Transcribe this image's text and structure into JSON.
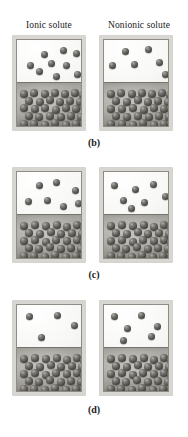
{
  "figure": {
    "background_color": "#ffffff",
    "sphere_color": "#56544f",
    "liquid_color": "#a8a6a0",
    "vapor_color": "#f7f7f5",
    "frame_color": "#d8d6d1"
  },
  "column_headers": [
    {
      "id": "ionic",
      "label": "Ionic solute"
    },
    {
      "id": "nonionic",
      "label": "Nonionic solute"
    }
  ],
  "panels": [
    {
      "id": "b",
      "caption": "(b)",
      "liquid_level_pct": 50,
      "beakers": [
        {
          "column": "ionic",
          "vapor_particles": [
            {
              "x": 24,
              "y": 11
            },
            {
              "x": 43,
              "y": 7
            },
            {
              "x": 56,
              "y": 10
            },
            {
              "x": 10,
              "y": 22
            },
            {
              "x": 31,
              "y": 20
            },
            {
              "x": 46,
              "y": 22
            },
            {
              "x": 19,
              "y": 28
            },
            {
              "x": 36,
              "y": 33
            },
            {
              "x": 57,
              "y": 31
            }
          ],
          "liquid_particles": [
            {
              "x": 3,
              "y": 50
            },
            {
              "x": 13,
              "y": 49
            },
            {
              "x": 24,
              "y": 50
            },
            {
              "x": 34,
              "y": 49
            },
            {
              "x": 44,
              "y": 50
            },
            {
              "x": 54,
              "y": 49
            },
            {
              "x": 62,
              "y": 51
            },
            {
              "x": 8,
              "y": 57
            },
            {
              "x": 19,
              "y": 58
            },
            {
              "x": 29,
              "y": 56
            },
            {
              "x": 39,
              "y": 58
            },
            {
              "x": 49,
              "y": 57
            },
            {
              "x": 59,
              "y": 58
            },
            {
              "x": 3,
              "y": 64
            },
            {
              "x": 14,
              "y": 65
            },
            {
              "x": 24,
              "y": 64
            },
            {
              "x": 35,
              "y": 66
            },
            {
              "x": 45,
              "y": 64
            },
            {
              "x": 55,
              "y": 65
            },
            {
              "x": 63,
              "y": 63
            },
            {
              "x": 8,
              "y": 72
            },
            {
              "x": 18,
              "y": 73
            },
            {
              "x": 29,
              "y": 72
            },
            {
              "x": 40,
              "y": 73
            },
            {
              "x": 50,
              "y": 72
            },
            {
              "x": 60,
              "y": 73
            },
            {
              "x": 3,
              "y": 80
            },
            {
              "x": 13,
              "y": 80
            },
            {
              "x": 24,
              "y": 81
            },
            {
              "x": 34,
              "y": 79
            },
            {
              "x": 45,
              "y": 81
            },
            {
              "x": 55,
              "y": 80
            },
            {
              "x": 63,
              "y": 79
            }
          ]
        },
        {
          "column": "nonionic",
          "vapor_particles": [
            {
              "x": 18,
              "y": 8
            },
            {
              "x": 41,
              "y": 6
            },
            {
              "x": 5,
              "y": 22
            },
            {
              "x": 27,
              "y": 21
            },
            {
              "x": 52,
              "y": 19
            },
            {
              "x": 58,
              "y": 31
            }
          ],
          "liquid_particles": [
            {
              "x": 3,
              "y": 50
            },
            {
              "x": 13,
              "y": 49
            },
            {
              "x": 24,
              "y": 50
            },
            {
              "x": 34,
              "y": 49
            },
            {
              "x": 44,
              "y": 50
            },
            {
              "x": 54,
              "y": 49
            },
            {
              "x": 62,
              "y": 51
            },
            {
              "x": 8,
              "y": 57
            },
            {
              "x": 19,
              "y": 58
            },
            {
              "x": 30,
              "y": 56
            },
            {
              "x": 40,
              "y": 58
            },
            {
              "x": 50,
              "y": 57
            },
            {
              "x": 60,
              "y": 58
            },
            {
              "x": 3,
              "y": 65
            },
            {
              "x": 14,
              "y": 65
            },
            {
              "x": 25,
              "y": 64
            },
            {
              "x": 36,
              "y": 66
            },
            {
              "x": 46,
              "y": 64
            },
            {
              "x": 56,
              "y": 65
            },
            {
              "x": 63,
              "y": 64
            },
            {
              "x": 8,
              "y": 72
            },
            {
              "x": 19,
              "y": 73
            },
            {
              "x": 30,
              "y": 72
            },
            {
              "x": 41,
              "y": 73
            },
            {
              "x": 51,
              "y": 72
            },
            {
              "x": 61,
              "y": 73
            },
            {
              "x": 3,
              "y": 80
            },
            {
              "x": 14,
              "y": 80
            },
            {
              "x": 25,
              "y": 81
            },
            {
              "x": 35,
              "y": 79
            },
            {
              "x": 46,
              "y": 81
            },
            {
              "x": 56,
              "y": 80
            },
            {
              "x": 63,
              "y": 79
            }
          ]
        }
      ]
    },
    {
      "id": "c",
      "caption": "(c)",
      "liquid_level_pct": 50,
      "beakers": [
        {
          "column": "ionic",
          "vapor_particles": [
            {
              "x": 19,
              "y": 10
            },
            {
              "x": 36,
              "y": 7
            },
            {
              "x": 55,
              "y": 15
            },
            {
              "x": 8,
              "y": 26
            },
            {
              "x": 27,
              "y": 25
            },
            {
              "x": 43,
              "y": 31
            },
            {
              "x": 58,
              "y": 28
            }
          ],
          "liquid_particles": [
            {
              "x": 3,
              "y": 50
            },
            {
              "x": 14,
              "y": 49
            },
            {
              "x": 25,
              "y": 50
            },
            {
              "x": 36,
              "y": 49
            },
            {
              "x": 46,
              "y": 51
            },
            {
              "x": 56,
              "y": 49
            },
            {
              "x": 63,
              "y": 51
            },
            {
              "x": 8,
              "y": 57
            },
            {
              "x": 19,
              "y": 58
            },
            {
              "x": 30,
              "y": 56
            },
            {
              "x": 40,
              "y": 58
            },
            {
              "x": 51,
              "y": 57
            },
            {
              "x": 61,
              "y": 58
            },
            {
              "x": 3,
              "y": 65
            },
            {
              "x": 14,
              "y": 64
            },
            {
              "x": 25,
              "y": 66
            },
            {
              "x": 35,
              "y": 64
            },
            {
              "x": 46,
              "y": 65
            },
            {
              "x": 56,
              "y": 64
            },
            {
              "x": 63,
              "y": 66
            },
            {
              "x": 8,
              "y": 72
            },
            {
              "x": 18,
              "y": 73
            },
            {
              "x": 29,
              "y": 71
            },
            {
              "x": 40,
              "y": 73
            },
            {
              "x": 50,
              "y": 72
            },
            {
              "x": 60,
              "y": 73
            },
            {
              "x": 3,
              "y": 80
            },
            {
              "x": 13,
              "y": 80
            },
            {
              "x": 24,
              "y": 81
            },
            {
              "x": 34,
              "y": 79
            },
            {
              "x": 45,
              "y": 81
            },
            {
              "x": 55,
              "y": 80
            },
            {
              "x": 63,
              "y": 79
            }
          ]
        },
        {
          "column": "nonionic",
          "vapor_particles": [
            {
              "x": 7,
              "y": 10
            },
            {
              "x": 28,
              "y": 14
            },
            {
              "x": 46,
              "y": 9
            },
            {
              "x": 16,
              "y": 25
            },
            {
              "x": 37,
              "y": 27
            },
            {
              "x": 58,
              "y": 21
            },
            {
              "x": 24,
              "y": 33
            }
          ],
          "liquid_particles": [
            {
              "x": 3,
              "y": 50
            },
            {
              "x": 14,
              "y": 49
            },
            {
              "x": 25,
              "y": 50
            },
            {
              "x": 36,
              "y": 49
            },
            {
              "x": 46,
              "y": 51
            },
            {
              "x": 56,
              "y": 49
            },
            {
              "x": 63,
              "y": 51
            },
            {
              "x": 8,
              "y": 57
            },
            {
              "x": 19,
              "y": 58
            },
            {
              "x": 30,
              "y": 56
            },
            {
              "x": 40,
              "y": 58
            },
            {
              "x": 51,
              "y": 57
            },
            {
              "x": 61,
              "y": 58
            },
            {
              "x": 3,
              "y": 65
            },
            {
              "x": 14,
              "y": 64
            },
            {
              "x": 25,
              "y": 66
            },
            {
              "x": 35,
              "y": 64
            },
            {
              "x": 46,
              "y": 65
            },
            {
              "x": 56,
              "y": 64
            },
            {
              "x": 63,
              "y": 66
            },
            {
              "x": 8,
              "y": 72
            },
            {
              "x": 18,
              "y": 73
            },
            {
              "x": 29,
              "y": 71
            },
            {
              "x": 40,
              "y": 73
            },
            {
              "x": 50,
              "y": 72
            },
            {
              "x": 60,
              "y": 73
            },
            {
              "x": 3,
              "y": 80
            },
            {
              "x": 13,
              "y": 80
            },
            {
              "x": 24,
              "y": 81
            },
            {
              "x": 34,
              "y": 79
            },
            {
              "x": 45,
              "y": 81
            },
            {
              "x": 55,
              "y": 80
            },
            {
              "x": 63,
              "y": 79
            }
          ]
        }
      ]
    },
    {
      "id": "d",
      "caption": "(d)",
      "liquid_level_pct": 50,
      "beakers": [
        {
          "column": "ionic",
          "vapor_particles": [
            {
              "x": 9,
              "y": 8
            },
            {
              "x": 37,
              "y": 7
            },
            {
              "x": 54,
              "y": 17
            },
            {
              "x": 21,
              "y": 29
            }
          ],
          "liquid_particles": [
            {
              "x": 3,
              "y": 50
            },
            {
              "x": 14,
              "y": 49
            },
            {
              "x": 25,
              "y": 50
            },
            {
              "x": 36,
              "y": 49
            },
            {
              "x": 46,
              "y": 51
            },
            {
              "x": 56,
              "y": 49
            },
            {
              "x": 63,
              "y": 51
            },
            {
              "x": 8,
              "y": 57
            },
            {
              "x": 19,
              "y": 58
            },
            {
              "x": 30,
              "y": 56
            },
            {
              "x": 40,
              "y": 58
            },
            {
              "x": 51,
              "y": 57
            },
            {
              "x": 61,
              "y": 58
            },
            {
              "x": 3,
              "y": 65
            },
            {
              "x": 14,
              "y": 64
            },
            {
              "x": 25,
              "y": 66
            },
            {
              "x": 35,
              "y": 64
            },
            {
              "x": 46,
              "y": 65
            },
            {
              "x": 56,
              "y": 64
            },
            {
              "x": 63,
              "y": 66
            },
            {
              "x": 8,
              "y": 72
            },
            {
              "x": 18,
              "y": 73
            },
            {
              "x": 29,
              "y": 71
            },
            {
              "x": 40,
              "y": 73
            },
            {
              "x": 50,
              "y": 72
            },
            {
              "x": 60,
              "y": 73
            },
            {
              "x": 3,
              "y": 80
            },
            {
              "x": 13,
              "y": 80
            },
            {
              "x": 24,
              "y": 81
            },
            {
              "x": 34,
              "y": 79
            },
            {
              "x": 45,
              "y": 81
            },
            {
              "x": 55,
              "y": 80
            },
            {
              "x": 63,
              "y": 79
            }
          ]
        },
        {
          "column": "nonionic",
          "vapor_particles": [
            {
              "x": 7,
              "y": 8
            },
            {
              "x": 34,
              "y": 7
            },
            {
              "x": 20,
              "y": 20
            },
            {
              "x": 50,
              "y": 18
            },
            {
              "x": 16,
              "y": 32
            },
            {
              "x": 44,
              "y": 28
            }
          ],
          "liquid_particles": [
            {
              "x": 3,
              "y": 50
            },
            {
              "x": 14,
              "y": 49
            },
            {
              "x": 25,
              "y": 50
            },
            {
              "x": 36,
              "y": 49
            },
            {
              "x": 46,
              "y": 51
            },
            {
              "x": 56,
              "y": 49
            },
            {
              "x": 63,
              "y": 51
            },
            {
              "x": 8,
              "y": 57
            },
            {
              "x": 19,
              "y": 58
            },
            {
              "x": 30,
              "y": 56
            },
            {
              "x": 40,
              "y": 58
            },
            {
              "x": 51,
              "y": 57
            },
            {
              "x": 61,
              "y": 58
            },
            {
              "x": 3,
              "y": 65
            },
            {
              "x": 14,
              "y": 64
            },
            {
              "x": 25,
              "y": 66
            },
            {
              "x": 35,
              "y": 64
            },
            {
              "x": 46,
              "y": 65
            },
            {
              "x": 56,
              "y": 64
            },
            {
              "x": 63,
              "y": 66
            },
            {
              "x": 8,
              "y": 72
            },
            {
              "x": 18,
              "y": 73
            },
            {
              "x": 29,
              "y": 71
            },
            {
              "x": 40,
              "y": 73
            },
            {
              "x": 50,
              "y": 72
            },
            {
              "x": 60,
              "y": 73
            },
            {
              "x": 3,
              "y": 80
            },
            {
              "x": 13,
              "y": 80
            },
            {
              "x": 24,
              "y": 81
            },
            {
              "x": 34,
              "y": 79
            },
            {
              "x": 45,
              "y": 81
            },
            {
              "x": 55,
              "y": 80
            },
            {
              "x": 63,
              "y": 79
            }
          ]
        }
      ]
    }
  ]
}
